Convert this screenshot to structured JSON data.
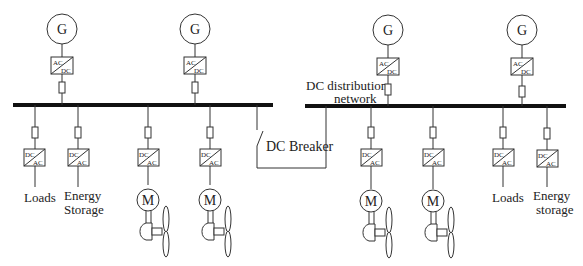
{
  "diagram": {
    "labels": {
      "generator": "G",
      "motor": "M",
      "rectifier_top": "AC",
      "rectifier_bottom": "DC",
      "inverter_top": "DC",
      "inverter_bottom": "AC",
      "dc_breaker": "DC Breaker",
      "dc_network_line1": "DC distribution",
      "dc_network_line2": "network",
      "loads_left": "Loads",
      "energy_storage_left_1": "Energy",
      "energy_storage_left_2": "Storage",
      "loads_right": "Loads",
      "energy_storage_right_1": "Energy",
      "energy_storage_right_2": "storage"
    },
    "left_bus": {
      "generators": 2,
      "feeders": [
        "Loads",
        "Energy Storage",
        "Propulsion motor",
        "Propulsion motor"
      ]
    },
    "right_bus": {
      "generators": 2,
      "feeders": [
        "Propulsion motor",
        "Propulsion motor",
        "Loads",
        "Energy storage"
      ]
    },
    "colors": {
      "line": "#333333",
      "bus": "#111111",
      "background": "#ffffff"
    }
  }
}
